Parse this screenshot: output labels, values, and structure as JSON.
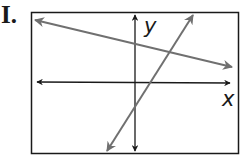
{
  "figure": {
    "label": "I.",
    "axes": {
      "x_label": "x",
      "y_label": "y"
    },
    "colors": {
      "axes": "#1a1a1a",
      "lines": "#707070",
      "frame": "#1a1a1a",
      "background": "#ffffff"
    },
    "lines": [
      {
        "name": "shallow-decreasing-line",
        "slope_sign": "negative",
        "y_intercept_sign": "positive"
      },
      {
        "name": "steep-increasing-line",
        "slope_sign": "positive",
        "y_intercept_sign": "negative"
      }
    ],
    "intersection": {
      "quadrant": "I"
    }
  }
}
